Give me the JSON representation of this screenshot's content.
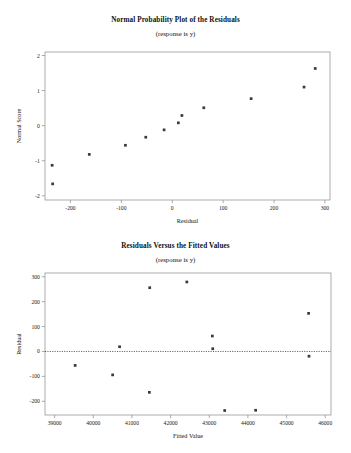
{
  "chart_data": [
    {
      "type": "scatter",
      "name": "normal-probability-plot",
      "title": "Normal Probability Plot of the Residuals",
      "subtitle": "(response is y)",
      "xlabel": "Residual",
      "ylabel": "Normal Score",
      "xlim": [
        -250,
        310
      ],
      "ylim": [
        -2.12,
        2.1
      ],
      "xticks": [
        -200,
        -100,
        0,
        100,
        200,
        300
      ],
      "xtick_labels": [
        "-200",
        "-100",
        "0",
        "100",
        "200",
        "300"
      ],
      "yticks": [
        -2,
        -1,
        0,
        1,
        2
      ],
      "ytick_labels": [
        "-2",
        "-1",
        "0",
        "1",
        "2"
      ],
      "grid": false,
      "legend": "none",
      "points": [
        {
          "x": -235,
          "y": -1.66
        },
        {
          "x": -236,
          "y": -1.13
        },
        {
          "x": -163,
          "y": -0.82
        },
        {
          "x": -92,
          "y": -0.56
        },
        {
          "x": -52,
          "y": -0.33
        },
        {
          "x": -16,
          "y": -0.12
        },
        {
          "x": 12,
          "y": 0.08
        },
        {
          "x": 19,
          "y": 0.29
        },
        {
          "x": 62,
          "y": 0.51
        },
        {
          "x": 155,
          "y": 0.77
        },
        {
          "x": 259,
          "y": 1.1
        },
        {
          "x": 281,
          "y": 1.63
        }
      ]
    },
    {
      "type": "scatter",
      "name": "residuals-versus-fitted-values",
      "title": "Residuals Versus the Fitted Values",
      "subtitle": "(response is y)",
      "xlabel": "Fitted Value",
      "ylabel": "Residual",
      "xlim": [
        38750,
        46150
      ],
      "ylim": [
        -255,
        315
      ],
      "xticks": [
        39000,
        40000,
        41000,
        42000,
        43000,
        44000,
        45000,
        46000
      ],
      "xtick_labels": [
        "39000",
        "40000",
        "41000",
        "42000",
        "43000",
        "44000",
        "45000",
        "46000"
      ],
      "yticks": [
        -200,
        -100,
        0,
        100,
        200,
        300
      ],
      "ytick_labels": [
        "-200",
        "-100",
        "0",
        "100",
        "200",
        "300"
      ],
      "grid": false,
      "legend": "none",
      "reference_line": {
        "y": 0,
        "style": "dotted"
      },
      "points": [
        {
          "x": 39530,
          "y": -56
        },
        {
          "x": 40500,
          "y": -94
        },
        {
          "x": 40680,
          "y": 19
        },
        {
          "x": 41460,
          "y": 256
        },
        {
          "x": 41450,
          "y": -164
        },
        {
          "x": 42420,
          "y": 279
        },
        {
          "x": 43080,
          "y": 62
        },
        {
          "x": 43090,
          "y": 11
        },
        {
          "x": 43400,
          "y": -237
        },
        {
          "x": 44200,
          "y": -236
        },
        {
          "x": 45570,
          "y": 153
        },
        {
          "x": 45580,
          "y": -19
        }
      ]
    }
  ]
}
